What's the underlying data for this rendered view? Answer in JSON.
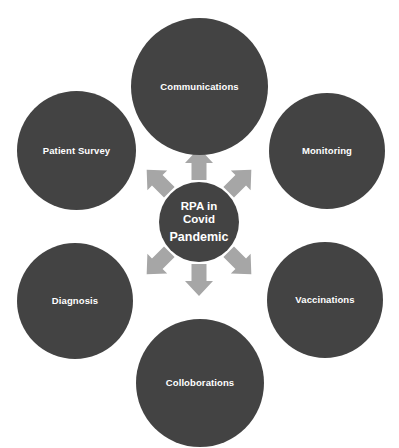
{
  "diagram": {
    "type": "radial-hub-and-spoke",
    "background_color": "#ffffff",
    "node_color": "#434343",
    "arrow_color": "#a6a6a6",
    "label_color": "#ffffff",
    "hub": {
      "name": "rpa-in-covid-pandemic",
      "lines": [
        "RPA in",
        "Covid",
        "Pandemic"
      ],
      "full_text": "RPA in Covid Pandemic"
    },
    "satellites": [
      {
        "id": "communications",
        "label": "Communications",
        "position": "top"
      },
      {
        "id": "monitoring",
        "label": "Monitoring",
        "position": "upper-right"
      },
      {
        "id": "vaccinations",
        "label": "Vaccinations",
        "position": "lower-right"
      },
      {
        "id": "colloborations",
        "label": "Colloborations",
        "position": "bottom"
      },
      {
        "id": "diagnosis",
        "label": "Diagnosis",
        "position": "lower-left"
      },
      {
        "id": "patient-survey",
        "label": "Patient Survey",
        "position": "upper-left"
      }
    ],
    "arrows": [
      {
        "id": "arrow-up",
        "direction": "up",
        "from": "rpa-in-covid-pandemic",
        "to": "communications"
      },
      {
        "id": "arrow-up-right",
        "direction": "up-right",
        "from": "rpa-in-covid-pandemic",
        "to": "monitoring"
      },
      {
        "id": "arrow-down-right",
        "direction": "down-right",
        "from": "rpa-in-covid-pandemic",
        "to": "vaccinations"
      },
      {
        "id": "arrow-down",
        "direction": "down",
        "from": "rpa-in-covid-pandemic",
        "to": "colloborations"
      },
      {
        "id": "arrow-down-left",
        "direction": "down-left",
        "from": "rpa-in-covid-pandemic",
        "to": "diagnosis"
      },
      {
        "id": "arrow-up-left",
        "direction": "up-left",
        "from": "rpa-in-covid-pandemic",
        "to": "patient-survey"
      }
    ]
  }
}
